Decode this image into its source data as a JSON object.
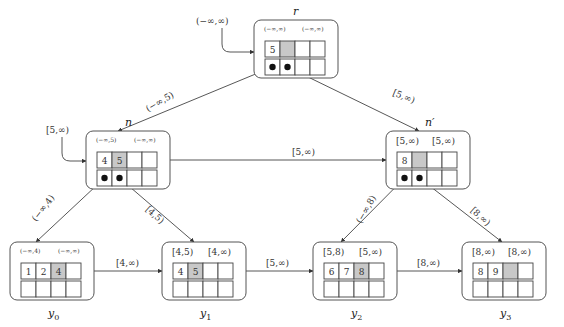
{
  "diagram": {
    "title": "",
    "entry_labels": {
      "root_entry": "(−∞,∞)",
      "n_entry": "[5,∞)"
    },
    "nodes": [
      {
        "id": "r",
        "name": "r",
        "type": "inner",
        "low_fence": "(−∞,∞)",
        "high_fence": "(−∞,∞)",
        "keys": [
          "5",
          "",
          "",
          ""
        ],
        "gray_index": 1,
        "pointers": [
          true,
          true,
          false,
          false
        ]
      },
      {
        "id": "n",
        "name": "n",
        "type": "inner",
        "low_fence": "(−∞,5)",
        "high_fence": "(−∞,∞)",
        "keys": [
          "4",
          "5",
          "",
          ""
        ],
        "gray_index": 1,
        "pointers": [
          true,
          true,
          false,
          false
        ]
      },
      {
        "id": "n_prime",
        "name": "n′",
        "type": "inner",
        "low_fence": "[5,∞)",
        "high_fence": "[5,∞)",
        "keys": [
          "8",
          "",
          "",
          ""
        ],
        "gray_index": 1,
        "pointers": [
          true,
          true,
          false,
          false
        ]
      },
      {
        "id": "y0",
        "name": "y0",
        "name_main": "y",
        "name_sub": "0",
        "type": "leaf",
        "low_fence": "(−∞,4)",
        "high_fence": "(−∞,∞)",
        "keys": [
          "1",
          "2",
          "4",
          ""
        ],
        "gray_index": 2
      },
      {
        "id": "y1",
        "name": "y1",
        "name_main": "y",
        "name_sub": "1",
        "type": "leaf",
        "low_fence": "[4,5)",
        "high_fence": "[4,∞)",
        "keys": [
          "4",
          "5",
          "",
          ""
        ],
        "gray_index": 1
      },
      {
        "id": "y2",
        "name": "y2",
        "name_main": "y",
        "name_sub": "2",
        "type": "leaf",
        "low_fence": "[5,8)",
        "high_fence": "[5,∞)",
        "keys": [
          "6",
          "7",
          "8",
          ""
        ],
        "gray_index": 2
      },
      {
        "id": "y3",
        "name": "y3",
        "name_main": "y",
        "name_sub": "3",
        "type": "leaf",
        "low_fence": "[8,∞)",
        "high_fence": "[8,∞)",
        "keys": [
          "8",
          "9",
          "",
          ""
        ],
        "gray_index": 2
      }
    ],
    "edges": [
      {
        "from": "r",
        "to": "n",
        "label": "(−∞,5)"
      },
      {
        "from": "r",
        "to": "n_prime",
        "label": "[5,∞)"
      },
      {
        "from": "n",
        "to": "n_prime",
        "label": "[5,∞)"
      },
      {
        "from": "n",
        "to": "y0",
        "label": "(−∞,4)"
      },
      {
        "from": "n",
        "to": "y1",
        "label": "[4,5)"
      },
      {
        "from": "n_prime",
        "to": "y2",
        "label": "(−∞,8)"
      },
      {
        "from": "n_prime",
        "to": "y3",
        "label": "[8,∞)"
      },
      {
        "from": "y0",
        "to": "y1",
        "label": "[4,∞)"
      },
      {
        "from": "y1",
        "to": "y2",
        "label": "[5,∞)"
      },
      {
        "from": "y2",
        "to": "y3",
        "label": "[8,∞)"
      }
    ]
  },
  "colors": {
    "gray_cell": "#c8c8c8",
    "stroke": "#444444"
  }
}
